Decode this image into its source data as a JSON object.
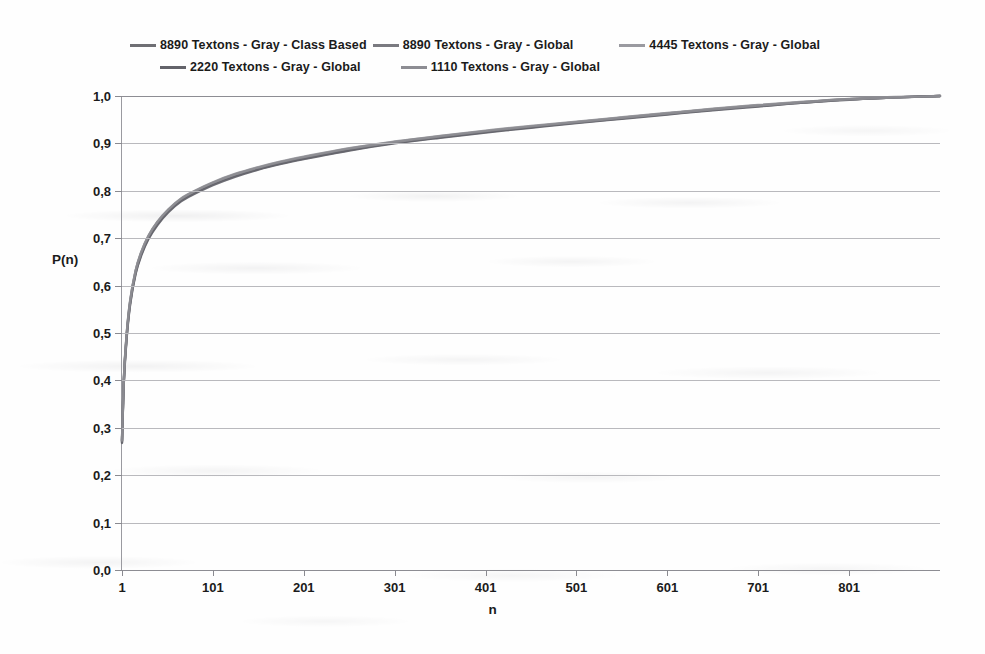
{
  "chart_data": {
    "type": "line",
    "title": "",
    "xlabel": "n",
    "ylabel": "P(n)",
    "xlim": [
      1,
      901
    ],
    "ylim": [
      0,
      1
    ],
    "grid": true,
    "legend_position": "top",
    "x_ticks": [
      "1",
      "101",
      "201",
      "301",
      "401",
      "501",
      "601",
      "701",
      "801"
    ],
    "x_tick_values": [
      1,
      101,
      201,
      301,
      401,
      501,
      601,
      701,
      801
    ],
    "y_ticks": [
      "0,0",
      "0,1",
      "0,2",
      "0,3",
      "0,4",
      "0,5",
      "0,6",
      "0,7",
      "0,8",
      "0,9",
      "1,0"
    ],
    "y_tick_values": [
      0.0,
      0.1,
      0.2,
      0.3,
      0.4,
      0.5,
      0.6,
      0.7,
      0.8,
      0.9,
      1.0
    ],
    "x": [
      1,
      3,
      6,
      10,
      16,
      22,
      30,
      40,
      52,
      66,
      81,
      101,
      126,
      151,
      176,
      201,
      251,
      301,
      351,
      401,
      451,
      501,
      551,
      601,
      651,
      701,
      751,
      801,
      851,
      901
    ],
    "series": [
      {
        "name": "8890 Textons - Gray - Class Based",
        "color": "#6f6f74",
        "values": [
          0.272,
          0.4,
          0.492,
          0.566,
          0.63,
          0.668,
          0.703,
          0.733,
          0.759,
          0.782,
          0.798,
          0.816,
          0.834,
          0.848,
          0.86,
          0.87,
          0.888,
          0.902,
          0.914,
          0.925,
          0.935,
          0.945,
          0.954,
          0.963,
          0.972,
          0.98,
          0.987,
          0.993,
          0.997,
          1.0
        ]
      },
      {
        "name": "8890 Textons - Gray - Global",
        "color": "#7a7a80",
        "values": [
          0.27,
          0.397,
          0.489,
          0.563,
          0.627,
          0.665,
          0.7,
          0.73,
          0.757,
          0.78,
          0.796,
          0.814,
          0.832,
          0.846,
          0.858,
          0.868,
          0.886,
          0.901,
          0.913,
          0.924,
          0.934,
          0.944,
          0.953,
          0.962,
          0.971,
          0.979,
          0.986,
          0.993,
          0.997,
          1.0
        ]
      },
      {
        "name": "4445  Textons  - Gray - Global",
        "color": "#9a9aa0",
        "values": [
          0.275,
          0.403,
          0.495,
          0.569,
          0.632,
          0.67,
          0.705,
          0.735,
          0.761,
          0.784,
          0.8,
          0.818,
          0.836,
          0.85,
          0.862,
          0.872,
          0.89,
          0.904,
          0.916,
          0.927,
          0.937,
          0.946,
          0.955,
          0.964,
          0.973,
          0.981,
          0.988,
          0.994,
          0.998,
          1.0
        ]
      },
      {
        "name": "2220  Textons - Gray - Global",
        "color": "#63636a",
        "values": [
          0.268,
          0.395,
          0.487,
          0.561,
          0.625,
          0.663,
          0.698,
          0.728,
          0.755,
          0.778,
          0.794,
          0.812,
          0.83,
          0.845,
          0.857,
          0.867,
          0.885,
          0.9,
          0.912,
          0.923,
          0.933,
          0.943,
          0.952,
          0.961,
          0.97,
          0.978,
          0.986,
          0.992,
          0.997,
          1.0
        ]
      },
      {
        "name": "1110  Textons  - Gray - Global",
        "color": "#8d8d93",
        "values": [
          0.273,
          0.401,
          0.493,
          0.567,
          0.631,
          0.669,
          0.704,
          0.734,
          0.76,
          0.783,
          0.799,
          0.817,
          0.835,
          0.849,
          0.861,
          0.871,
          0.889,
          0.903,
          0.915,
          0.926,
          0.936,
          0.945,
          0.954,
          0.963,
          0.972,
          0.98,
          0.987,
          0.993,
          0.997,
          1.0
        ]
      }
    ]
  },
  "legend": {
    "rows": [
      [
        {
          "label": "8890 Textons - Gray - Class Based",
          "color": "#6f6f74",
          "gap": "none"
        },
        {
          "label": "8890 Textons - Gray - Global",
          "color": "#7a7a80",
          "gap": "none"
        },
        {
          "label": "4445  Textons  - Gray - Global",
          "color": "#9a9aa0",
          "gap": "lg"
        }
      ],
      [
        {
          "label": "2220  Textons - Gray - Global",
          "color": "#63636a",
          "gap": "none"
        },
        {
          "label": "1110  Textons  - Gray - Global",
          "color": "#8d8d93",
          "gap": "xl"
        }
      ]
    ]
  }
}
